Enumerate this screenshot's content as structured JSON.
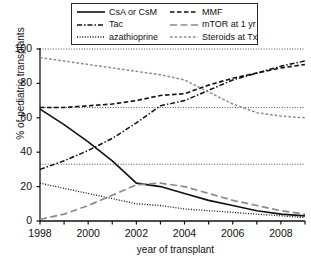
{
  "chart_data": {
    "type": "line",
    "title": "",
    "xlabel": "year of transplant",
    "ylabel": "% of pediatric transplants",
    "xlim": [
      1998,
      2009
    ],
    "ylim": [
      0,
      100
    ],
    "grid": "horizontal dotted gridlines at 33 and 66",
    "legend_position": "top-center",
    "xticks": [
      1998,
      1999,
      2000,
      2001,
      2002,
      2003,
      2004,
      2005,
      2006,
      2007,
      2008,
      2009
    ],
    "xticklabels": [
      "1998",
      "",
      "2000",
      "",
      "2002",
      "",
      "2004",
      "",
      "2006",
      "",
      "2008",
      ""
    ],
    "yticks": [
      0,
      20,
      40,
      60,
      80,
      100
    ],
    "yticklabels": [
      "0",
      "20",
      "40",
      "60",
      "80",
      "100"
    ],
    "x": [
      1998,
      1999,
      2000,
      2001,
      2002,
      2003,
      2004,
      2005,
      2006,
      2007,
      2008,
      2009
    ],
    "series": [
      {
        "name": "CsA or CsM",
        "style": "solid",
        "color": "#111111",
        "values": [
          65,
          56,
          46,
          35,
          22,
          20,
          16,
          12,
          9,
          6,
          4,
          3
        ]
      },
      {
        "name": "Tac",
        "style": "dashdot",
        "color": "#111111",
        "values": [
          30,
          35,
          41,
          48,
          57,
          67,
          70,
          76,
          82,
          86,
          90,
          93
        ]
      },
      {
        "name": "azathioprine",
        "style": "dotted",
        "color": "#111111",
        "values": [
          22,
          19,
          16,
          13,
          10,
          9,
          7,
          6,
          5,
          4,
          3,
          2
        ]
      },
      {
        "name": "MMF",
        "style": "dashed",
        "color": "#111111",
        "values": [
          66,
          66,
          67,
          68,
          70,
          73,
          74,
          79,
          83,
          86,
          89,
          91
        ]
      },
      {
        "name": "mTOR at 1 yr",
        "style": "longdash",
        "color": "#8a8a8a",
        "values": [
          1,
          4,
          9,
          15,
          21,
          22,
          20,
          16,
          12,
          9,
          6,
          4
        ]
      },
      {
        "name": "Steroids at Tx",
        "style": "dashed-gray",
        "color": "#8a8a8a",
        "values": [
          95,
          93,
          91,
          89,
          87,
          85,
          82,
          75,
          68,
          63,
          61,
          60
        ]
      }
    ]
  },
  "legend": {
    "column_a": [
      {
        "label": "CsA or CsM",
        "key": "solid-line-key"
      },
      {
        "label": "Tac",
        "key": "dashdot-line-key"
      },
      {
        "label": "azathioprine",
        "key": "dotted-line-key"
      }
    ],
    "column_b": [
      {
        "label": "MMF",
        "key": "dashed-line-key"
      },
      {
        "label": "mTOR at 1 yr",
        "key": "longdash-line-key"
      },
      {
        "label": "Steroids at Tx",
        "key": "gray-dashed-line-key"
      }
    ]
  }
}
